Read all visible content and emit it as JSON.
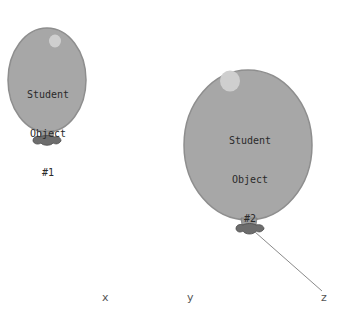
{
  "balloons": [
    {
      "label_line1": "Student",
      "label_line2": "Object",
      "label_line3": "#1"
    },
    {
      "label_line1": "Student",
      "label_line2": "Object",
      "label_line3": "#2"
    }
  ],
  "axis_labels": {
    "x": "x",
    "y": "y",
    "z": "z"
  },
  "colors": {
    "balloon_fill": "#a7a7a7",
    "balloon_stroke": "#8c8c8c",
    "highlight": "#cfcfcf",
    "knot": "#6d6d6d",
    "string": "#8a8a8a"
  }
}
